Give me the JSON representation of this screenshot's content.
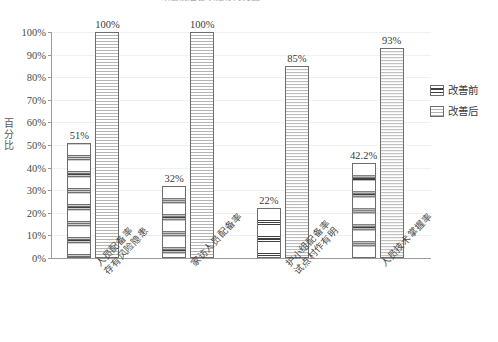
{
  "chart_data": {
    "type": "bar",
    "title": "改善前后各项指标对比图",
    "xlabel": "",
    "ylabel": "百分比",
    "ylim": [
      0,
      100
    ],
    "ytick_labels": [
      "0%",
      "10%",
      "20%",
      "30%",
      "40%",
      "50%",
      "60%",
      "70%",
      "80%",
      "90%",
      "100%"
    ],
    "ytick_values": [
      0,
      10,
      20,
      30,
      40,
      50,
      60,
      70,
      80,
      90,
      100
    ],
    "grid": true,
    "legend_position": "right",
    "categories": [
      "人员配备率\n存有风险隐患",
      "家访人员配备率",
      "护小组配备率\n试点村作有明",
      "人员技术掌握率"
    ],
    "category_lines": [
      [
        "人员配备率",
        "存有风险隐患"
      ],
      [
        "家访人员配备率"
      ],
      [
        "护小组配备率",
        "试点村作有明"
      ],
      [
        "人员技术掌握率"
      ]
    ],
    "series": [
      {
        "name": "改善前",
        "values": [
          51,
          32,
          22,
          42.2
        ],
        "labels": [
          "51%",
          "32%",
          "22%",
          "42.2%"
        ],
        "fill": "thick-dark-horizontal-stripes",
        "color": "#3f3f3f"
      },
      {
        "name": "改善后",
        "values": [
          100,
          100,
          85,
          93
        ],
        "labels": [
          "100%",
          "100%",
          "85%",
          "93%"
        ],
        "fill": "fine-light-horizontal-lines",
        "color": "#b4b4b4"
      }
    ]
  },
  "legend": {
    "items": [
      {
        "label": "改善前",
        "swatch": "before"
      },
      {
        "label": "改善后",
        "swatch": "after"
      }
    ]
  },
  "axes": {
    "y_title": "百分比",
    "border_color": "#9b9b9b",
    "gridline_color": "#eef1f4"
  }
}
